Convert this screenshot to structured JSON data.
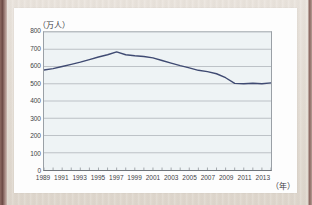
{
  "page": {
    "background_color": "#e6e0d8",
    "paper_color": "#fdfdfd"
  },
  "chart_data": {
    "type": "line",
    "title": "",
    "subtitle": "",
    "xlabel": "（年）",
    "ylabel": "（万人）",
    "y_unit_caption": "（万人）",
    "x_unit_caption": "（年）",
    "ylim": [
      0,
      800
    ],
    "y_tick_step": 100,
    "y_ticks": [
      800,
      700,
      600,
      500,
      400,
      300,
      200,
      100,
      0
    ],
    "y_tick_labels": [
      "800",
      "700",
      "600",
      "500",
      "400",
      "300",
      "200",
      "100",
      "0"
    ],
    "xlim": [
      1989,
      2014
    ],
    "x_tick_years": [
      1989,
      1990,
      1991,
      1992,
      1993,
      1994,
      1995,
      1996,
      1997,
      1998,
      1999,
      2000,
      2001,
      2002,
      2003,
      2004,
      2005,
      2006,
      2007,
      2008,
      2009,
      2010,
      2011,
      2012,
      2013,
      2014
    ],
    "x_labeled_years": [
      1989,
      1991,
      1993,
      1995,
      1997,
      1999,
      2001,
      2003,
      2005,
      2007,
      2009,
      2011,
      2013
    ],
    "x_tick_labels": [
      "1989",
      "1991",
      "1993",
      "1995",
      "1997",
      "1999",
      "2001",
      "2003",
      "2005",
      "2007",
      "2009",
      "2011",
      "2013"
    ],
    "grid": true,
    "grid_axis": "y",
    "grid_color": "#9aa0a6",
    "plot_background": "#eef3f5",
    "legend": "none",
    "series": [
      {
        "name": "",
        "color": "#3f4a72",
        "line_width": 1.4,
        "markers": false,
        "x": [
          1989,
          1990,
          1991,
          1992,
          1993,
          1994,
          1995,
          1996,
          1997,
          1998,
          1999,
          2000,
          2001,
          2002,
          2003,
          2004,
          2005,
          2006,
          2007,
          2008,
          2009,
          2010,
          2011,
          2012,
          2013,
          2014
        ],
        "values": [
          580,
          588,
          600,
          612,
          625,
          640,
          655,
          668,
          685,
          668,
          662,
          658,
          650,
          635,
          620,
          605,
          592,
          578,
          570,
          558,
          535,
          502,
          500,
          503,
          500,
          505
        ]
      }
    ]
  }
}
